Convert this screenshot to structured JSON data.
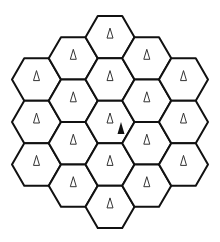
{
  "diagram": {
    "grid": {
      "orientation": "flat-top",
      "rings": 2,
      "cell_count": 19,
      "columns": [
        {
          "column": -2,
          "rows": [
            -1,
            0,
            1
          ]
        },
        {
          "column": -1,
          "rows": [
            -1.5,
            -0.5,
            0.5,
            1.5
          ]
        },
        {
          "column": 0,
          "rows": [
            -2,
            -1,
            0,
            1,
            2
          ]
        },
        {
          "column": 1,
          "rows": [
            -1.5,
            -0.5,
            0.5,
            1.5
          ]
        },
        {
          "column": 2,
          "rows": [
            -1,
            0,
            1
          ]
        }
      ]
    },
    "cell_marker": {
      "icon": "base-station-icon",
      "style": "outline-triangle"
    },
    "mobile_user": {
      "icon": "mobile-user-icon",
      "style": "filled-triangle",
      "cell": {
        "column": 0,
        "row": 0
      }
    },
    "colors": {
      "stroke": "#111111",
      "fill": "#ffffff",
      "marker": "#333333",
      "mobile": "#111111"
    }
  }
}
